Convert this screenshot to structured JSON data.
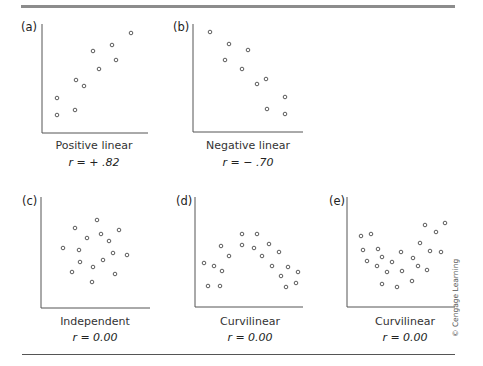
{
  "figure": {
    "credit": "© Cengage Learning",
    "colors": {
      "axis": "#555555",
      "marker": "#333333",
      "rule": "#8c8c8c"
    }
  },
  "panels": [
    {
      "letter": "(a)",
      "caption": "Positive linear",
      "r": "r = + .82"
    },
    {
      "letter": "(b)",
      "caption": "Negative linear",
      "r": "r = − .70"
    },
    {
      "letter": "(c)",
      "caption": "Independent",
      "r": "r = 0.00"
    },
    {
      "letter": "(d)",
      "caption": "Curvilinear",
      "r": "r = 0.00"
    },
    {
      "letter": "(e)",
      "caption": "Curvilinear",
      "r": "r = 0.00"
    }
  ],
  "chart_data": [
    {
      "type": "scatter",
      "title": "(a) Positive linear",
      "annotation": "r = +.82",
      "xlabel": "",
      "ylabel": "",
      "grid": false,
      "legend": "none",
      "axes_px": {
        "x0": 42,
        "y0": 133,
        "x1": 148,
        "ytop": 24
      },
      "points_px": [
        [
          57,
          115
        ],
        [
          57,
          98
        ],
        [
          75,
          110
        ],
        [
          76,
          80
        ],
        [
          84,
          86
        ],
        [
          93,
          51
        ],
        [
          99,
          69
        ],
        [
          112,
          45
        ],
        [
          116,
          60
        ],
        [
          131,
          33
        ]
      ]
    },
    {
      "type": "scatter",
      "title": "(b) Negative linear",
      "annotation": "r = −.70",
      "xlabel": "",
      "ylabel": "",
      "grid": false,
      "legend": "none",
      "axes_px": {
        "x0": 193,
        "y0": 132,
        "x1": 303,
        "ytop": 24
      },
      "points_px": [
        [
          210,
          32
        ],
        [
          229,
          44
        ],
        [
          248,
          50
        ],
        [
          225,
          60
        ],
        [
          242,
          69
        ],
        [
          266,
          79
        ],
        [
          257,
          84
        ],
        [
          285,
          97
        ],
        [
          267,
          109
        ],
        [
          285,
          114
        ]
      ]
    },
    {
      "type": "scatter",
      "title": "(c) Independent",
      "annotation": "r = 0.00",
      "xlabel": "",
      "ylabel": "",
      "grid": false,
      "legend": "none",
      "axes_px": {
        "x0": 41,
        "y0": 308,
        "x1": 150,
        "ytop": 197
      },
      "points_px": [
        [
          97,
          220
        ],
        [
          75,
          228
        ],
        [
          119,
          230
        ],
        [
          101,
          234
        ],
        [
          87,
          238
        ],
        [
          109,
          241
        ],
        [
          63,
          248
        ],
        [
          79,
          250
        ],
        [
          113,
          253
        ],
        [
          127,
          255
        ],
        [
          103,
          260
        ],
        [
          80,
          262
        ],
        [
          93,
          267
        ],
        [
          72,
          272
        ],
        [
          115,
          274
        ],
        [
          92,
          282
        ]
      ]
    },
    {
      "type": "scatter",
      "title": "(d) Curvilinear",
      "annotation": "r = 0.00",
      "xlabel": "",
      "ylabel": "",
      "grid": false,
      "legend": "none",
      "axes_px": {
        "x0": 195,
        "y0": 307,
        "x1": 303,
        "ytop": 197
      },
      "points_px": [
        [
          242,
          234
        ],
        [
          257,
          234
        ],
        [
          221,
          246
        ],
        [
          242,
          245
        ],
        [
          254,
          248
        ],
        [
          269,
          244
        ],
        [
          279,
          252
        ],
        [
          229,
          256
        ],
        [
          262,
          256
        ],
        [
          204,
          263
        ],
        [
          214,
          266
        ],
        [
          272,
          266
        ],
        [
          288,
          267
        ],
        [
          222,
          271
        ],
        [
          298,
          272
        ],
        [
          281,
          276
        ],
        [
          208,
          286
        ],
        [
          220,
          286
        ],
        [
          296,
          283
        ],
        [
          286,
          287
        ]
      ]
    },
    {
      "type": "scatter",
      "title": "(e) Curvilinear",
      "annotation": "r = 0.00",
      "xlabel": "",
      "ylabel": "",
      "grid": false,
      "legend": "none",
      "axes_px": {
        "x0": 347,
        "y0": 307,
        "x1": 455,
        "ytop": 197
      },
      "points_px": [
        [
          361,
          236
        ],
        [
          371,
          234
        ],
        [
          363,
          250
        ],
        [
          378,
          249
        ],
        [
          367,
          261
        ],
        [
          382,
          257
        ],
        [
          377,
          266
        ],
        [
          392,
          262
        ],
        [
          387,
          272
        ],
        [
          401,
          252
        ],
        [
          402,
          271
        ],
        [
          413,
          258
        ],
        [
          418,
          266
        ],
        [
          427,
          270
        ],
        [
          420,
          243
        ],
        [
          430,
          251
        ],
        [
          441,
          252
        ],
        [
          425,
          225
        ],
        [
          436,
          232
        ],
        [
          445,
          223
        ],
        [
          382,
          284
        ],
        [
          397,
          287
        ],
        [
          412,
          281
        ]
      ]
    }
  ]
}
